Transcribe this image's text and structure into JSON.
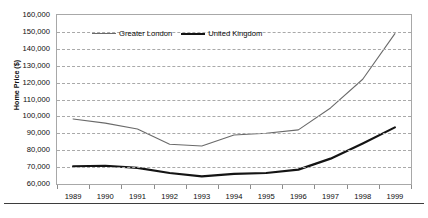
{
  "chart_data": {
    "type": "line",
    "title": "",
    "xlabel": "",
    "ylabel": "Home Price ($)",
    "categories": [
      "1989",
      "1990",
      "1991",
      "1992",
      "1993",
      "1994",
      "1995",
      "1996",
      "1997",
      "1998",
      "1999"
    ],
    "x": [
      1989,
      1990,
      1991,
      1992,
      1993,
      1994,
      1995,
      1996,
      1997,
      1998,
      1999
    ],
    "ylim": [
      60000,
      160000
    ],
    "ytick_step": 10000,
    "ytick_labels": [
      "60,000",
      "70,000",
      "80,000",
      "90,000",
      "100,000",
      "110,000",
      "120,000",
      "130,000",
      "140,000",
      "150,000",
      "160,000"
    ],
    "ytick_values": [
      60000,
      70000,
      80000,
      90000,
      100000,
      110000,
      120000,
      130000,
      140000,
      150000,
      160000
    ],
    "grid": "horizontal-dashed",
    "legend_position": "inside-top-left",
    "series": [
      {
        "name": "Greater London",
        "color": "#6a6a6a",
        "line_width": 1.1,
        "values": [
          98500,
          96000,
          92500,
          83500,
          82500,
          89000,
          90000,
          92000,
          105000,
          122000,
          149000
        ]
      },
      {
        "name": "United Kingdom",
        "color": "#141414",
        "line_width": 2.2,
        "values": [
          70500,
          70800,
          69500,
          66500,
          64500,
          66000,
          66500,
          68500,
          75000,
          84000,
          93500
        ]
      }
    ]
  },
  "legend": {
    "entries": [
      {
        "label": "Greater London"
      },
      {
        "label": "United Kingdom"
      }
    ]
  },
  "axes": {
    "y_title": "Home Price ($)"
  },
  "colors": {
    "greater_london": "#6a6a6a",
    "united_kingdom": "#141414",
    "gridline": "#a9a9a9",
    "frame": "#a8a8a8",
    "rule": "#3d3d3d",
    "background": "#ffffff"
  }
}
